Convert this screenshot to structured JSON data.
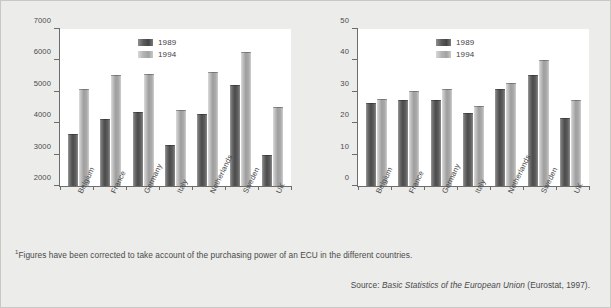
{
  "figure": {
    "footnote_marker": "1",
    "footnote": "Figures have been corrected to take account of the purchasing power of an ECU in the different countries.",
    "source_prefix": "Source:",
    "source_title": "Basic Statistics of the European Union",
    "source_suffix": "(Eurostat, 1997)."
  },
  "chart_data": [
    {
      "type": "bar",
      "id": "ecu-per-head",
      "title": "",
      "xlabel": "",
      "ylabel": "ECU per head",
      "ylabel_superscript": "1",
      "ylim": [
        2000,
        7000
      ],
      "yticks": [
        2000,
        3000,
        4000,
        5000,
        6000,
        7000
      ],
      "ytick_labels": [
        "2000",
        "3000",
        "4000",
        "5000",
        "6000",
        "7000"
      ],
      "grid": false,
      "legend_position": "top-center",
      "categories": [
        "Belgium",
        "France",
        "Germany",
        "Italy",
        "Netherlands",
        "Sweden",
        "UK"
      ],
      "series": [
        {
          "name": "1989",
          "color": "#4b4b4b",
          "values": [
            3650,
            4120,
            4370,
            3320,
            4280,
            5230,
            3000
          ]
        },
        {
          "name": "1994",
          "color": "#a8a8a8",
          "values": [
            5100,
            5520,
            5560,
            4410,
            5620,
            6280,
            4520
          ]
        }
      ]
    },
    {
      "type": "bar",
      "id": "percent-of-gdp",
      "title": "",
      "xlabel": "",
      "ylabel": "% of GDP",
      "ylim": [
        0,
        50
      ],
      "yticks": [
        0,
        10,
        20,
        30,
        40,
        50
      ],
      "ytick_labels": [
        "0",
        "10",
        "20",
        "30",
        "40",
        "50"
      ],
      "grid": false,
      "legend_position": "top-center",
      "categories": [
        "Belgium",
        "France",
        "Germany",
        "Italy",
        "Netherlands",
        "Sweden",
        "UK"
      ],
      "series": [
        {
          "name": "1989",
          "color": "#4b4b4b",
          "values": [
            26.5,
            27.4,
            27.5,
            23.1,
            31.0,
            35.2,
            21.8
          ]
        },
        {
          "name": "1994",
          "color": "#a8a8a8",
          "values": [
            27.6,
            30.3,
            31.0,
            25.6,
            32.9,
            40.0,
            27.3
          ]
        }
      ]
    }
  ]
}
